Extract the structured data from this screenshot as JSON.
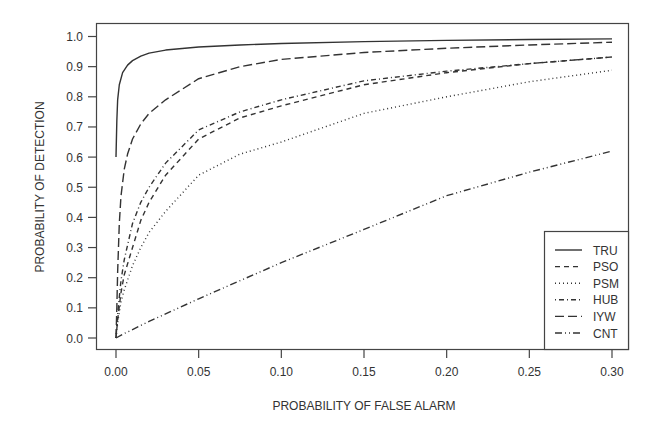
{
  "chart_data": {
    "type": "line",
    "title": "",
    "xlabel": "PROBABILITY OF FALSE ALARM",
    "ylabel": "PROBABILITY OF DETECTION",
    "xlim": [
      0.0,
      0.3
    ],
    "ylim": [
      0.0,
      1.0
    ],
    "x_ticks": [
      "0.00",
      "0.05",
      "0.10",
      "0.15",
      "0.20",
      "0.25",
      "0.30"
    ],
    "y_ticks": [
      "0.0",
      "0.1",
      "0.2",
      "0.3",
      "0.4",
      "0.5",
      "0.6",
      "0.7",
      "0.8",
      "0.9",
      "1.0"
    ],
    "grid": false,
    "legend_position": "lower right",
    "series": [
      {
        "name": "TRU",
        "style": "solid",
        "x": [
          0.0,
          0.0005,
          0.001,
          0.002,
          0.004,
          0.007,
          0.01,
          0.015,
          0.02,
          0.03,
          0.05,
          0.075,
          0.1,
          0.15,
          0.2,
          0.25,
          0.3
        ],
        "y": [
          0.6,
          0.72,
          0.79,
          0.84,
          0.88,
          0.905,
          0.92,
          0.935,
          0.945,
          0.955,
          0.965,
          0.972,
          0.977,
          0.983,
          0.987,
          0.99,
          0.992
        ]
      },
      {
        "name": "PSO",
        "style": "dashed",
        "x": [
          0.0,
          0.001,
          0.003,
          0.005,
          0.01,
          0.015,
          0.02,
          0.03,
          0.05,
          0.075,
          0.1,
          0.15,
          0.2,
          0.25,
          0.3
        ],
        "y": [
          0.0,
          0.06,
          0.15,
          0.21,
          0.3,
          0.39,
          0.45,
          0.54,
          0.66,
          0.73,
          0.77,
          0.84,
          0.88,
          0.91,
          0.932
        ]
      },
      {
        "name": "PSM",
        "style": "dotted",
        "x": [
          0.0,
          0.001,
          0.003,
          0.005,
          0.01,
          0.015,
          0.02,
          0.03,
          0.05,
          0.075,
          0.1,
          0.15,
          0.2,
          0.25,
          0.3
        ],
        "y": [
          0.0,
          0.05,
          0.12,
          0.16,
          0.24,
          0.3,
          0.35,
          0.42,
          0.54,
          0.61,
          0.65,
          0.745,
          0.8,
          0.85,
          0.888
        ]
      },
      {
        "name": "HUB",
        "style": "dashdot",
        "x": [
          0.0,
          0.001,
          0.003,
          0.005,
          0.01,
          0.015,
          0.02,
          0.03,
          0.05,
          0.075,
          0.1,
          0.15,
          0.2,
          0.25,
          0.3
        ],
        "y": [
          0.0,
          0.08,
          0.19,
          0.26,
          0.38,
          0.45,
          0.5,
          0.58,
          0.69,
          0.75,
          0.79,
          0.853,
          0.885,
          0.91,
          0.932
        ]
      },
      {
        "name": "IYW",
        "style": "longdash",
        "x": [
          0.0,
          0.0005,
          0.001,
          0.002,
          0.003,
          0.005,
          0.007,
          0.01,
          0.015,
          0.02,
          0.03,
          0.05,
          0.075,
          0.1,
          0.15,
          0.2,
          0.25,
          0.3
        ],
        "y": [
          0.0,
          0.1,
          0.22,
          0.38,
          0.47,
          0.56,
          0.61,
          0.66,
          0.71,
          0.745,
          0.79,
          0.86,
          0.9,
          0.924,
          0.947,
          0.961,
          0.972,
          0.981
        ]
      },
      {
        "name": "CNT",
        "style": "dashdotdot",
        "x": [
          0.0,
          0.005,
          0.01,
          0.02,
          0.05,
          0.1,
          0.15,
          0.2,
          0.25,
          0.3
        ],
        "y": [
          0.0,
          0.015,
          0.028,
          0.055,
          0.13,
          0.25,
          0.36,
          0.472,
          0.55,
          0.62
        ]
      }
    ]
  },
  "legend": {
    "items": [
      {
        "label": "TRU",
        "style": "solid"
      },
      {
        "label": "PSO",
        "style": "dashed"
      },
      {
        "label": "PSM",
        "style": "dotted"
      },
      {
        "label": "HUB",
        "style": "dashdot"
      },
      {
        "label": "IYW",
        "style": "longdash"
      },
      {
        "label": "CNT",
        "style": "dashdotdot"
      }
    ]
  },
  "colors": {
    "line": "#333333",
    "axis": "#444444",
    "background": "#ffffff"
  }
}
